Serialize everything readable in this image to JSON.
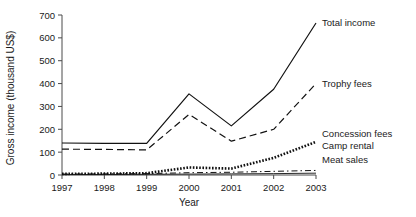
{
  "chart_data": {
    "type": "line",
    "title": "",
    "xlabel": "Year",
    "ylabel": "Gross income (thousand US$)",
    "categories": [
      1997,
      1998,
      1999,
      2000,
      2001,
      2002,
      2003
    ],
    "x": [
      "1997",
      "1998",
      "1999",
      "2000",
      "2001",
      "2002",
      "2003"
    ],
    "xlim": [
      1997,
      2003
    ],
    "ylim": [
      0,
      700
    ],
    "yticks": [
      0,
      100,
      200,
      300,
      400,
      500,
      600,
      700
    ],
    "xticks": [
      "1997",
      "1998",
      "1999",
      "2000",
      "2001",
      "2002",
      "2003"
    ],
    "grid": false,
    "legend_position": "right-inline",
    "series": [
      {
        "name": "Total income",
        "style": "solid",
        "values": [
          140,
          138,
          138,
          355,
          215,
          375,
          665
        ]
      },
      {
        "name": "Trophy fees",
        "style": "dashed",
        "values": [
          113,
          112,
          110,
          265,
          148,
          200,
          400
        ]
      },
      {
        "name": "Concession fees",
        "style": "dotted-thick",
        "values": [
          5,
          6,
          8,
          33,
          28,
          75,
          145
        ]
      },
      {
        "name": "Camp rental",
        "style": "dash-dot",
        "values": [
          4,
          5,
          6,
          10,
          12,
          16,
          20
        ]
      },
      {
        "name": "Meat sales",
        "style": "thin-solid",
        "values": [
          2,
          2,
          3,
          4,
          5,
          6,
          8
        ]
      }
    ]
  },
  "axis": {
    "y_label": "Gross income (thousand US$)",
    "x_label": "Year",
    "y_tick_labels": [
      "0",
      "100",
      "200",
      "300",
      "400",
      "500",
      "600",
      "700"
    ],
    "x_tick_labels": [
      "1997",
      "1998",
      "1999",
      "2000",
      "2001",
      "2002",
      "2003"
    ]
  },
  "legend": {
    "items": [
      {
        "label": "Total income"
      },
      {
        "label": "Trophy fees"
      },
      {
        "label": "Concession fees"
      },
      {
        "label": "Camp rental"
      },
      {
        "label": "Meat sales"
      }
    ]
  },
  "colors": {
    "ink": "#111111",
    "axis": "#4a4a4a",
    "background": "#ffffff"
  }
}
